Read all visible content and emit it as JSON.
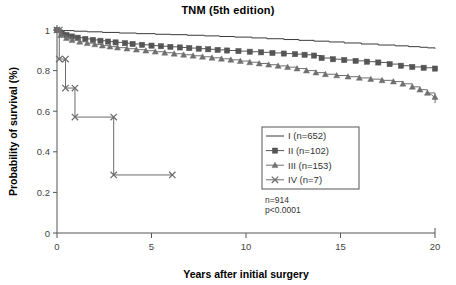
{
  "chart_data": {
    "type": "line",
    "title": "TNM (5th edition)",
    "xlabel": "Years after initial surgery",
    "ylabel": "Probability of survival (%)",
    "xlim": [
      0,
      20
    ],
    "ylim": [
      0,
      1
    ],
    "xticks": [
      0,
      5,
      10,
      15,
      20
    ],
    "xticklabels": [
      "0",
      "5",
      "10",
      "15",
      "20"
    ],
    "yticks": [
      0,
      0.2,
      0.4,
      0.6,
      0.8,
      1
    ],
    "yticklabels": [
      "0",
      "0.2",
      "0.4",
      "0.6",
      "0.8",
      "1"
    ],
    "grid": false,
    "legend_position": "center-right",
    "annotations": [
      "n=914",
      "p<0.0001"
    ],
    "total_n": 914,
    "p_value": "p<0.0001",
    "series": [
      {
        "name": "I (n=652)",
        "stage": "I",
        "n": 652,
        "marker": "none",
        "color": "#3a3a3a",
        "x": [
          0,
          0.3,
          0.9,
          1.6,
          2.4,
          3.3,
          4.2,
          5.2,
          6.0,
          6.9,
          7.8,
          8.6,
          9.4,
          10.3,
          11.1,
          12.0,
          12.8,
          13.6,
          14.4,
          15.2,
          16.1,
          17.0,
          17.9,
          18.6,
          19.2,
          19.6,
          20.0
        ],
        "y": [
          1.0,
          0.997,
          0.994,
          0.991,
          0.988,
          0.985,
          0.982,
          0.979,
          0.977,
          0.974,
          0.971,
          0.968,
          0.965,
          0.961,
          0.957,
          0.953,
          0.949,
          0.945,
          0.941,
          0.936,
          0.931,
          0.926,
          0.922,
          0.918,
          0.915,
          0.912,
          0.908
        ]
      },
      {
        "name": "II (n=102)",
        "stage": "II",
        "n": 102,
        "marker": "square",
        "color": "#555555",
        "x": [
          0,
          0.25,
          0.5,
          0.8,
          1.1,
          1.5,
          1.9,
          2.3,
          2.7,
          3.1,
          3.6,
          4.0,
          4.5,
          5.0,
          5.5,
          6.0,
          6.5,
          7.0,
          7.5,
          8.0,
          8.5,
          9.0,
          9.6,
          10.2,
          10.8,
          11.4,
          12.0,
          12.6,
          13.1,
          13.6,
          14.0,
          14.6,
          15.2,
          15.8,
          16.4,
          17.0,
          17.6,
          18.2,
          18.8,
          19.4,
          20.0
        ],
        "y": [
          1.0,
          0.985,
          0.975,
          0.968,
          0.962,
          0.956,
          0.951,
          0.947,
          0.943,
          0.939,
          0.935,
          0.931,
          0.927,
          0.923,
          0.92,
          0.917,
          0.914,
          0.911,
          0.908,
          0.905,
          0.902,
          0.899,
          0.896,
          0.893,
          0.89,
          0.887,
          0.884,
          0.881,
          0.878,
          0.874,
          0.862,
          0.856,
          0.852,
          0.848,
          0.844,
          0.84,
          0.832,
          0.824,
          0.818,
          0.814,
          0.81
        ]
      },
      {
        "name": "III (n=153)",
        "stage": "III",
        "n": 153,
        "marker": "triangle",
        "color": "#707070",
        "x": [
          0,
          0.2,
          0.5,
          0.8,
          1.2,
          1.6,
          2.0,
          2.4,
          2.8,
          3.2,
          3.7,
          4.2,
          4.7,
          5.2,
          5.7,
          6.2,
          6.7,
          7.2,
          7.7,
          8.2,
          8.7,
          9.2,
          9.7,
          10.2,
          10.7,
          11.2,
          11.7,
          12.2,
          12.7,
          13.2,
          13.7,
          14.2,
          14.8,
          15.4,
          16.0,
          16.6,
          17.2,
          17.8,
          18.3,
          18.8,
          19.2,
          19.6,
          20.0
        ],
        "y": [
          1.0,
          0.975,
          0.96,
          0.95,
          0.942,
          0.935,
          0.929,
          0.923,
          0.918,
          0.913,
          0.908,
          0.903,
          0.898,
          0.893,
          0.888,
          0.883,
          0.878,
          0.873,
          0.868,
          0.863,
          0.858,
          0.853,
          0.847,
          0.841,
          0.835,
          0.829,
          0.823,
          0.817,
          0.81,
          0.8,
          0.79,
          0.782,
          0.776,
          0.77,
          0.764,
          0.758,
          0.752,
          0.746,
          0.735,
          0.72,
          0.706,
          0.69,
          0.67
        ]
      },
      {
        "name": "IV (n=7)",
        "stage": "IV",
        "n": 7,
        "marker": "x",
        "color": "#6b6b6b",
        "x": [
          0,
          0.12,
          0.12,
          0.45,
          0.45,
          0.95,
          0.95,
          3.0,
          3.0,
          6.1
        ],
        "y": [
          1.0,
          1.0,
          0.857,
          0.857,
          0.714,
          0.714,
          0.571,
          0.571,
          0.286,
          0.286
        ]
      }
    ]
  },
  "legend": {
    "entries": [
      {
        "label": "I (n=652)",
        "marker": "line"
      },
      {
        "label": "II (n=102)",
        "marker": "square"
      },
      {
        "label": "III (n=153)",
        "marker": "triangle"
      },
      {
        "label": "IV (n=7)",
        "marker": "x"
      }
    ]
  },
  "colors": {
    "axis": "#555555",
    "text": "#222222",
    "series_1": "#3a3a3a",
    "series_2": "#555555",
    "series_3": "#707070",
    "series_4": "#6b6b6b"
  }
}
